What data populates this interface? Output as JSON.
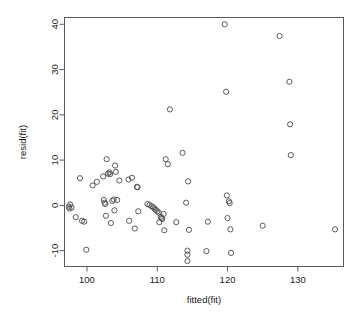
{
  "chart_data": {
    "type": "scatter",
    "title": "",
    "xlabel": "fitted(fit)",
    "ylabel": "resid(fit)",
    "xlim": [
      96.8,
      136.5
    ],
    "ylim": [
      -13.5,
      41.5
    ],
    "xticks": [
      100,
      110,
      120,
      130
    ],
    "xtick_labels": [
      "100",
      "110",
      "120",
      "130"
    ],
    "yticks": [
      -10,
      0,
      10,
      20,
      30,
      40
    ],
    "ytick_labels": [
      "-10",
      "0",
      "10",
      "20",
      "30",
      "40"
    ],
    "grid": false,
    "legend": null,
    "marker": "open-circle",
    "marker_color": "#4a4a4a",
    "points": [
      [
        97.4,
        -0.3
      ],
      [
        97.5,
        -0.7
      ],
      [
        97.6,
        0.2
      ],
      [
        97.8,
        -0.5
      ],
      [
        98.4,
        -2.6
      ],
      [
        99.0,
        6.0
      ],
      [
        99.3,
        -3.4
      ],
      [
        99.6,
        -3.6
      ],
      [
        99.9,
        -9.8
      ],
      [
        100.8,
        4.4
      ],
      [
        101.4,
        5.2
      ],
      [
        102.3,
        6.4
      ],
      [
        102.4,
        1.2
      ],
      [
        102.5,
        0.6
      ],
      [
        102.6,
        0.3
      ],
      [
        102.7,
        -2.3
      ],
      [
        102.8,
        10.2
      ],
      [
        103.0,
        7.0
      ],
      [
        103.2,
        7.3
      ],
      [
        103.3,
        6.9
      ],
      [
        103.4,
        -3.9
      ],
      [
        103.6,
        1.0
      ],
      [
        103.8,
        1.3
      ],
      [
        103.9,
        -1.1
      ],
      [
        104.0,
        8.8
      ],
      [
        104.1,
        7.4
      ],
      [
        104.3,
        1.2
      ],
      [
        104.6,
        5.5
      ],
      [
        105.9,
        5.7
      ],
      [
        106.0,
        -3.4
      ],
      [
        106.4,
        6.1
      ],
      [
        106.8,
        -5.1
      ],
      [
        107.1,
        4.1
      ],
      [
        107.2,
        4.0
      ],
      [
        107.3,
        -1.3
      ],
      [
        108.6,
        0.3
      ],
      [
        108.9,
        0.1
      ],
      [
        109.2,
        -0.2
      ],
      [
        109.4,
        -0.4
      ],
      [
        109.6,
        -0.7
      ],
      [
        109.8,
        -1.0
      ],
      [
        110.0,
        -1.3
      ],
      [
        110.2,
        -1.6
      ],
      [
        110.3,
        -3.7
      ],
      [
        110.5,
        -2.5
      ],
      [
        110.6,
        -2.8
      ],
      [
        110.7,
        -3.0
      ],
      [
        110.9,
        -1.9
      ],
      [
        111.0,
        -5.5
      ],
      [
        111.2,
        10.2
      ],
      [
        111.5,
        9.1
      ],
      [
        111.8,
        21.2
      ],
      [
        112.7,
        -3.7
      ],
      [
        113.6,
        11.6
      ],
      [
        114.1,
        0.6
      ],
      [
        114.3,
        -10.0
      ],
      [
        114.3,
        -10.9
      ],
      [
        114.3,
        -12.3
      ],
      [
        114.4,
        5.3
      ],
      [
        114.5,
        -5.4
      ],
      [
        117.0,
        -10.1
      ],
      [
        117.2,
        -3.6
      ],
      [
        119.6,
        40.0
      ],
      [
        119.8,
        25.1
      ],
      [
        119.9,
        2.2
      ],
      [
        120.0,
        -2.8
      ],
      [
        120.2,
        0.9
      ],
      [
        120.3,
        0.5
      ],
      [
        120.4,
        -5.3
      ],
      [
        120.5,
        -10.5
      ],
      [
        125.0,
        -4.5
      ],
      [
        127.4,
        37.4
      ],
      [
        128.8,
        27.3
      ],
      [
        128.9,
        17.9
      ],
      [
        129.0,
        11.1
      ],
      [
        135.3,
        -5.3
      ]
    ],
    "n_points": 76
  }
}
